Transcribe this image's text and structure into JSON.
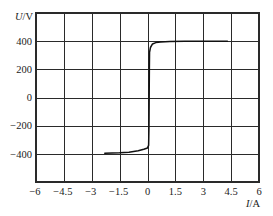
{
  "chart_data": {
    "type": "line",
    "title": "",
    "xlabel": "I/A",
    "ylabel": "U/V",
    "xlabel_parts": {
      "var": "I",
      "unit": "/A"
    },
    "ylabel_parts": {
      "var": "U",
      "unit": "/V"
    },
    "xlim": [
      -6,
      6
    ],
    "ylim": [
      -600,
      600
    ],
    "grid": true,
    "legend": null,
    "xticks": [
      -6,
      -4.5,
      -3,
      -1.5,
      0,
      1.5,
      3,
      4.5,
      6
    ],
    "xtick_labels": [
      "−6",
      "−4.5",
      "−3",
      "−1.5",
      "0",
      "1.5",
      "3",
      "4.5",
      "6"
    ],
    "yticks": [
      -600,
      -400,
      -200,
      0,
      200,
      400,
      600
    ],
    "ytick_labels": [
      "",
      "−400",
      "−200",
      "0",
      "200",
      "400",
      ""
    ],
    "series": [
      {
        "x": [
          -2.3,
          -1.5,
          -1.0,
          -0.5,
          -0.2,
          0.0,
          0.06,
          0.08,
          0.09,
          0.1,
          0.11,
          0.16,
          0.27,
          0.45,
          0.7,
          1.2,
          2.0,
          4.3
        ],
        "y": [
          -396,
          -393,
          -388,
          -378,
          -367,
          -358,
          -340,
          -200,
          0,
          200,
          320,
          355,
          380,
          390,
          394,
          398,
          400,
          400
        ],
        "color": "#111111"
      }
    ]
  },
  "colors": {
    "background": "#ffffff",
    "grid": "#2a2a2a",
    "curve": "#111111"
  }
}
